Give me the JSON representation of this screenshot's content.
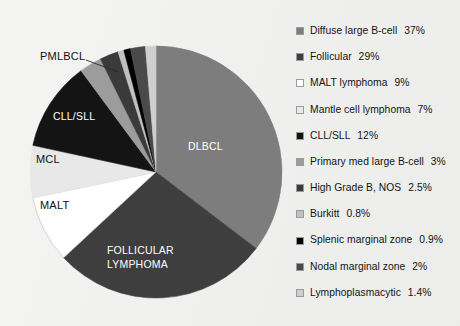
{
  "background_color": "#f1f1ef",
  "chart_data": {
    "type": "pie",
    "title": "",
    "subtitle": "",
    "xlabel": "",
    "ylabel": "",
    "legend_position": "right",
    "grid": false,
    "start_angle_deg": 0,
    "direction": "clockwise",
    "units": "percent",
    "categories": [
      "Diffuse large B-cell",
      "Follicular",
      "MALT lymphoma",
      "Mantle cell lymphoma",
      "CLL/SLL",
      "Primary med large B-cell",
      "High Grade B, NOS",
      "Burkitt",
      "Splenic marginal zone",
      "Nodal marginal zone",
      "Lymphoplasmacytic"
    ],
    "values": [
      37,
      29,
      9,
      7,
      12,
      3,
      2.5,
      0.8,
      0.9,
      2,
      1.4
    ],
    "value_labels": [
      "37%",
      "29%",
      "9%",
      "7%",
      "12%",
      "3%",
      "2.5%",
      "0.8%",
      "0.9%",
      "2%",
      "1.4%"
    ],
    "colors": [
      "#7d7d7d",
      "#3e3e3e",
      "#ffffff",
      "#e8e8e8",
      "#141414",
      "#9c9c9c",
      "#3a3a3a",
      "#c0c0c0",
      "#000000",
      "#4a4a4a",
      "#cfcfcf"
    ],
    "slices": [
      {
        "name": "Diffuse large B-cell",
        "value": 37,
        "label": "37%",
        "color": "#7d7d7d"
      },
      {
        "name": "Follicular",
        "value": 29,
        "label": "29%",
        "color": "#3e3e3e"
      },
      {
        "name": "MALT lymphoma",
        "value": 9,
        "label": "9%",
        "color": "#ffffff"
      },
      {
        "name": "Mantle cell lymphoma",
        "value": 7,
        "label": "7%",
        "color": "#e8e8e8"
      },
      {
        "name": "CLL/SLL",
        "value": 12,
        "label": "12%",
        "color": "#141414"
      },
      {
        "name": "Primary med large B-cell",
        "value": 3,
        "label": "3%",
        "color": "#9c9c9c"
      },
      {
        "name": "High Grade B, NOS",
        "value": 2.5,
        "label": "2.5%",
        "color": "#3a3a3a"
      },
      {
        "name": "Burkitt",
        "value": 0.8,
        "label": "0.8%",
        "color": "#c0c0c0"
      },
      {
        "name": "Splenic marginal zone",
        "value": 0.9,
        "label": "0.9%",
        "color": "#000000"
      },
      {
        "name": "Nodal marginal zone",
        "value": 2,
        "label": "2%",
        "color": "#4a4a4a"
      },
      {
        "name": "Lymphoplasmacytic",
        "value": 1.4,
        "label": "1.4%",
        "color": "#cfcfcf"
      }
    ]
  },
  "pie": {
    "inside_labels": [
      {
        "id": "dlbcl",
        "text": "DLBCL"
      },
      {
        "id": "follicular-line1",
        "text": "FOLLICULAR"
      },
      {
        "id": "follicular-line2",
        "text": "LYMPHOMA"
      },
      {
        "id": "cll-sll",
        "text": "CLL/SLL"
      }
    ],
    "callout_labels": [
      {
        "id": "pmlbcl",
        "text": "PMLBCL"
      },
      {
        "id": "mcl",
        "text": "MCL"
      },
      {
        "id": "malt",
        "text": "MALT"
      }
    ]
  },
  "legend": {
    "items": [
      {
        "label": "Diffuse large B-cell",
        "percent": "37%",
        "color": "#7d7d7d"
      },
      {
        "label": "Follicular",
        "percent": "29%",
        "color": "#3e3e3e"
      },
      {
        "label": "MALT lymphoma",
        "percent": "9%",
        "color": "#ffffff"
      },
      {
        "label": "Mantle cell lymphoma",
        "percent": "7%",
        "color": "#e8e8e8"
      },
      {
        "label": "CLL/SLL",
        "percent": "12%",
        "color": "#141414"
      },
      {
        "label": "Primary med large B-cell",
        "percent": "3%",
        "color": "#9c9c9c"
      },
      {
        "label": "High Grade B, NOS",
        "percent": "2.5%",
        "color": "#3a3a3a"
      },
      {
        "label": "Burkitt",
        "percent": "0.8%",
        "color": "#c0c0c0"
      },
      {
        "label": "Splenic marginal zone",
        "percent": "0.9%",
        "color": "#000000"
      },
      {
        "label": "Nodal marginal zone",
        "percent": "2%",
        "color": "#4a4a4a"
      },
      {
        "label": "Lymphoplasmacytic",
        "percent": "1.4%",
        "color": "#cfcfcf"
      }
    ]
  }
}
